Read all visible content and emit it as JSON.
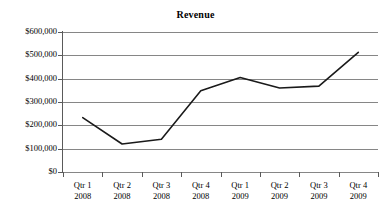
{
  "chart_data": {
    "type": "line",
    "title": "Revenue",
    "subtitle": "",
    "xlabel": "",
    "ylabel": "",
    "categories": [
      "Qtr 1 2008",
      "Qtr 2 2008",
      "Qtr 3 2008",
      "Qtr 4 2008",
      "Qtr 1 2009",
      "Qtr 2 2009",
      "Qtr 3 2009",
      "Qtr 4 2009"
    ],
    "category_lines": [
      [
        "Qtr 1",
        "2008"
      ],
      [
        "Qtr 2",
        "2008"
      ],
      [
        "Qtr 3",
        "2008"
      ],
      [
        "Qtr 4",
        "2008"
      ],
      [
        "Qtr 1",
        "2009"
      ],
      [
        "Qtr 2",
        "2009"
      ],
      [
        "Qtr 3",
        "2009"
      ],
      [
        "Qtr 4",
        "2009"
      ]
    ],
    "values": [
      233000,
      120000,
      140000,
      348000,
      405000,
      360000,
      368000,
      513000
    ],
    "series": [
      {
        "name": "Revenue",
        "values": [
          233000,
          120000,
          140000,
          348000,
          405000,
          360000,
          368000,
          513000
        ]
      }
    ],
    "ylim": [
      0,
      600000
    ],
    "ytick_values": [
      0,
      100000,
      200000,
      300000,
      400000,
      500000,
      600000
    ],
    "ytick_labels": [
      "$0",
      "$100,000",
      "$200,000",
      "$300,000",
      "$400,000",
      "$500,000",
      "$600,000"
    ],
    "grid": true,
    "grid_axis": "y",
    "legend": false,
    "legend_position": "none",
    "markers": false,
    "line_color": "#1a1a1a",
    "grid_color": "#868686",
    "axis_color": "#5a5a5a",
    "background_color": "#ffffff",
    "annotations": []
  },
  "axis": {
    "y_labels": [
      "$600,000",
      "$500,000",
      "$400,000",
      "$300,000",
      "$200,000",
      "$100,000",
      "$0"
    ]
  }
}
